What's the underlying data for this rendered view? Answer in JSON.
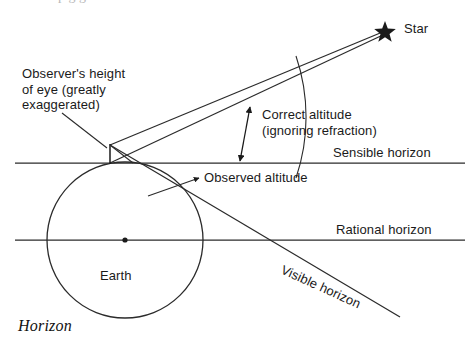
{
  "figure": {
    "caption": "Horizon",
    "top_bleed_text": "p g g"
  },
  "labels": {
    "star": "Star",
    "observer_height": "Observer's height\nof eye (greatly\nexaggerated)",
    "correct_altitude": "Correct altitude\n(ignoring refraction)",
    "sensible_horizon": "Sensible horizon",
    "observed_altitude": "Observed altitude",
    "rational_horizon": "Rational horizon",
    "visible_horizon": "Visible horizon",
    "earth": "Earth"
  },
  "colors": {
    "ink": "#1a1a1a",
    "line": "#2b2b2b",
    "background": "#ffffff"
  },
  "geometry": {
    "earth": {
      "cx": 125,
      "cy": 240,
      "r": 78
    },
    "eye": {
      "x": 110,
      "y": 145
    },
    "surface_point": {
      "x": 110,
      "y": 163
    },
    "star": {
      "x": 385,
      "y": 30
    },
    "sensible_horizon_y": 163,
    "rational_horizon_y": 240,
    "horizon_x_start": 15,
    "horizon_x_end": 465
  }
}
